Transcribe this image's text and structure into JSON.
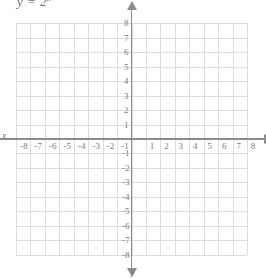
{
  "figure": {
    "type": "coordinate-plane",
    "equation_text": "y = 2",
    "equation_exponent": "x",
    "x_axis_name": "x",
    "y_axis_name": "y",
    "grid": "on",
    "colors": {
      "gridline": "#dcdcdc",
      "axis": "#8c8c8c",
      "label": "#7a7a7a",
      "background": "#ffffff"
    }
  },
  "chart_data": {
    "type": "line",
    "xlabel": "x",
    "ylabel": "y",
    "xlim": [
      -8,
      8
    ],
    "ylim": [
      -8,
      8
    ],
    "grid": true,
    "legend": "none",
    "series": [],
    "x_ticks": [
      "-8",
      "-7",
      "-6",
      "-5",
      "-4",
      "-3",
      "-2",
      "-1",
      "1",
      "2",
      "3",
      "4",
      "5",
      "6",
      "7",
      "8"
    ],
    "y_ticks": [
      "8",
      "7",
      "6",
      "5",
      "4",
      "3",
      "2",
      "1",
      "-1",
      "-2",
      "-3",
      "-4",
      "-5",
      "-6",
      "-7",
      "-8"
    ],
    "x_tick_values": [
      -8,
      -7,
      -6,
      -5,
      -4,
      -3,
      -2,
      -1,
      1,
      2,
      3,
      4,
      5,
      6,
      7,
      8
    ],
    "y_tick_values": [
      8,
      7,
      6,
      5,
      4,
      3,
      2,
      1,
      -1,
      -2,
      -3,
      -4,
      -5,
      -6,
      -7,
      -8
    ],
    "annotations": [
      "y = 2^x"
    ]
  }
}
